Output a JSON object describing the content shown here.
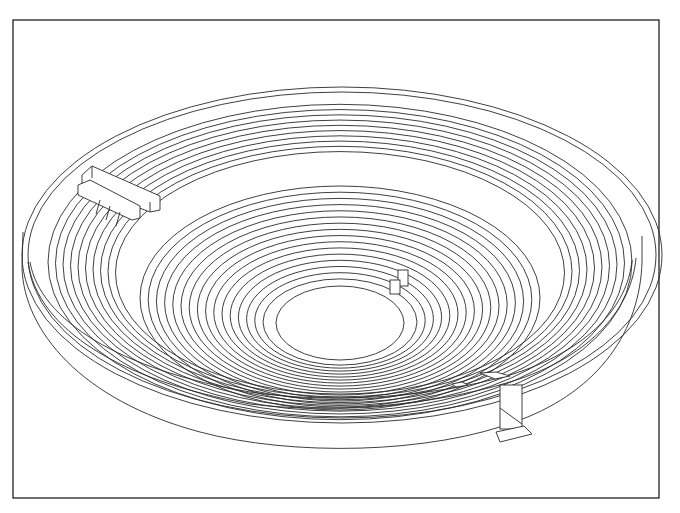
{
  "figure": {
    "frame": {
      "x": 13,
      "y": 20,
      "width": 646,
      "height": 478
    },
    "center": {
      "cx": 340,
      "cy": 322
    },
    "outer_wall": {
      "top_rim": [
        {
          "rx": 318,
          "ry": 180,
          "cy": 270
        },
        {
          "rx": 312,
          "ry": 175,
          "cy": 270
        }
      ],
      "base": {
        "rx": 318,
        "ry": 180,
        "cy": 330
      }
    },
    "upper_rows": {
      "count": 10,
      "rx_start": 292,
      "rx_step": 7.5,
      "ry_ratio": 0.54,
      "cy": 262
    },
    "lower_rows": {
      "count": 16,
      "rx_start": 200,
      "rx_step": 8.2,
      "ry_ratio": 0.56,
      "cy": 300
    },
    "orchestra": {
      "rx": 66,
      "ry": 40,
      "cx": 340,
      "cy": 325
    },
    "features": [
      {
        "name": "stair-block-upper-left",
        "x": 78,
        "y": 165
      },
      {
        "name": "small-pedestals-center",
        "x": 390,
        "y": 268
      },
      {
        "name": "entrance-passage-lower-right",
        "x": 483,
        "y": 383
      }
    ],
    "line_color": "#2a2a2a",
    "background": "#ffffff"
  }
}
